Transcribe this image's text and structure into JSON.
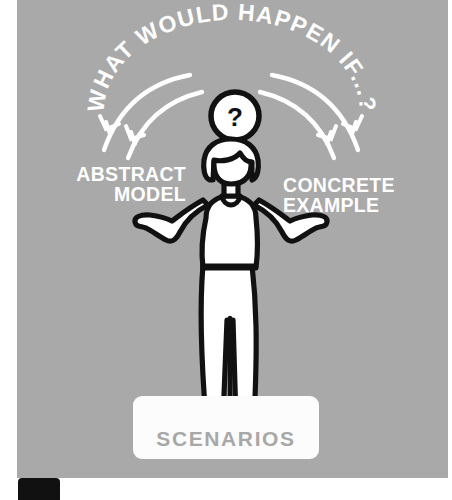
{
  "illustration": {
    "title": "Scenarios: abstract model and concrete example",
    "background_color": "#a9a9a9",
    "panel_color": "#a9a9a9",
    "ink_color": "#111111",
    "fill_color": "#ffffff",
    "curved_headline": "WHAT WOULD HAPPEN IF...?",
    "curved_headline_chars": [
      "W",
      "H",
      "A",
      "T",
      " ",
      "W",
      "O",
      "U",
      "L",
      "D",
      " ",
      "H",
      "A",
      "P",
      "P",
      "E",
      "N",
      " ",
      "I",
      "F",
      ".",
      ".",
      ".",
      "?"
    ],
    "thought_bubble": {
      "symbol": "?",
      "name": "question-mark"
    },
    "labels": {
      "left": "ABSTRACT\nMODEL",
      "right": "CONCRETE\nEXAMPLE"
    },
    "caption_box": {
      "text": "SCENARIOS",
      "background": "#fcfcfc",
      "text_color": "#a8a8a8"
    },
    "figure": {
      "name": "shrugging-person",
      "description": "person with bob haircut shrugging with open palms"
    },
    "arrows": {
      "left_count": 2,
      "right_count": 2,
      "color": "#ffffff",
      "direction_left": "down-left",
      "direction_right": "down-right"
    },
    "corner_badge": {
      "color": "#111111"
    }
  }
}
